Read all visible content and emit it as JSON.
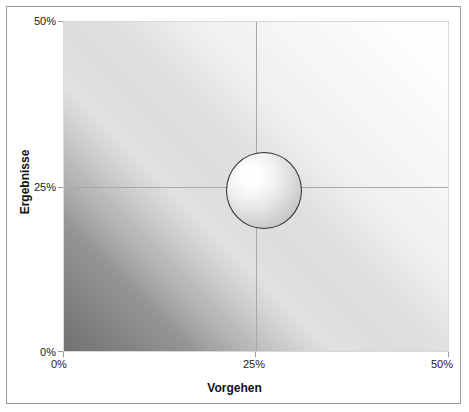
{
  "chart_data": {
    "type": "scatter",
    "title": "",
    "xlabel": "Vorgehen",
    "ylabel": "Ergebnisse",
    "xlim": [
      0,
      50
    ],
    "ylim": [
      0,
      50
    ],
    "xticks": [
      "0%",
      "25%",
      "50%"
    ],
    "yticks": [
      "0%",
      "25%",
      "50%"
    ],
    "grid": true,
    "legend": "none",
    "series": [
      {
        "name": "Position",
        "marker": "bubble-sphere",
        "points": [
          {
            "x": 25,
            "y": 25,
            "size_pct": 10
          }
        ]
      }
    ],
    "background": {
      "style": "diagonal-gradient",
      "direction": "bottom-left-dark to top-right-light",
      "dark_color": "#6e6e6e",
      "light_color": "#ffffff"
    },
    "annotations": []
  },
  "axes": {
    "x": {
      "title": "Vorgehen",
      "ticks": [
        {
          "label": "0%",
          "value": 0
        },
        {
          "label": "25%",
          "value": 25
        },
        {
          "label": "50%",
          "value": 50
        }
      ]
    },
    "y": {
      "title": "Ergebnisse",
      "ticks": [
        {
          "label": "0%",
          "value": 0
        },
        {
          "label": "25%",
          "value": 25
        },
        {
          "label": "50%",
          "value": 50
        }
      ]
    }
  },
  "colors": {
    "gradient_dark": "#6e6e6e",
    "gradient_light": "#ffffff",
    "gridline": "#a9a9a9",
    "bubble_outline": "#2f2f2f",
    "frame_border": "#9a9a9a",
    "text": "#111111"
  }
}
